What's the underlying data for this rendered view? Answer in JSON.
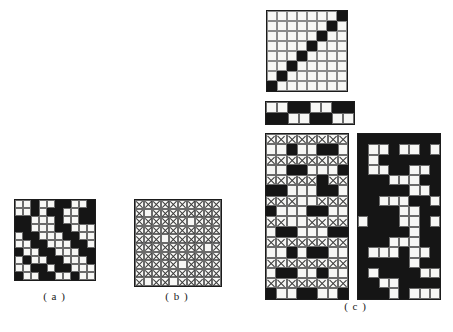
{
  "figure": {
    "kind": "binary-matrix-diagram",
    "background_color": "#ffffff",
    "ink_color": "#151515",
    "cell_fill_white": "#f7f7f5",
    "grid_line_color": "#6e6e6e",
    "cross_mark_color": "#3a3a3a"
  },
  "captions": {
    "a": "( a )",
    "b": "( b )",
    "c": "( c )"
  },
  "chart_data": {
    "type": "heatmap",
    "title": "",
    "xlabel": "",
    "ylabel": "",
    "legend": [
      {
        "name": "filled",
        "code": 1,
        "color": "#151515"
      },
      {
        "name": "empty",
        "code": 0,
        "color": "#f7f7f5"
      },
      {
        "name": "crossed",
        "code": 2,
        "color": "#f7f7f5"
      }
    ],
    "panels": [
      {
        "id": "a",
        "label": "( a )",
        "rows": 10,
        "cols": 10,
        "style": "binary",
        "matrix": [
          [
            0,
            0,
            1,
            0,
            0,
            1,
            1,
            0,
            0,
            1
          ],
          [
            0,
            0,
            1,
            0,
            1,
            1,
            0,
            0,
            1,
            1
          ],
          [
            1,
            1,
            0,
            0,
            0,
            1,
            0,
            0,
            1,
            1
          ],
          [
            1,
            1,
            0,
            0,
            0,
            1,
            1,
            0,
            0,
            0
          ],
          [
            0,
            1,
            1,
            0,
            0,
            0,
            1,
            1,
            0,
            0
          ],
          [
            0,
            0,
            1,
            1,
            0,
            0,
            0,
            1,
            1,
            0
          ],
          [
            1,
            0,
            0,
            1,
            1,
            0,
            0,
            0,
            1,
            1
          ],
          [
            0,
            1,
            0,
            0,
            1,
            1,
            0,
            0,
            0,
            1
          ],
          [
            0,
            0,
            1,
            1,
            0,
            1,
            1,
            0,
            0,
            0
          ],
          [
            1,
            0,
            0,
            1,
            1,
            0,
            0,
            1,
            0,
            0
          ]
        ]
      },
      {
        "id": "b",
        "label": "( b )",
        "rows": 10,
        "cols": 10,
        "style": "crossed",
        "matrix": [
          [
            2,
            2,
            2,
            2,
            2,
            2,
            2,
            2,
            2,
            2
          ],
          [
            2,
            0,
            2,
            2,
            2,
            2,
            2,
            2,
            2,
            2
          ],
          [
            2,
            2,
            2,
            2,
            2,
            2,
            0,
            2,
            2,
            2
          ],
          [
            2,
            2,
            2,
            2,
            2,
            2,
            2,
            2,
            2,
            2
          ],
          [
            2,
            2,
            2,
            0,
            2,
            2,
            2,
            2,
            2,
            2
          ],
          [
            2,
            2,
            2,
            2,
            2,
            2,
            2,
            2,
            0,
            2
          ],
          [
            2,
            2,
            2,
            2,
            2,
            2,
            2,
            2,
            2,
            2
          ],
          [
            2,
            2,
            2,
            2,
            2,
            0,
            2,
            2,
            2,
            2
          ],
          [
            2,
            2,
            2,
            2,
            2,
            2,
            2,
            2,
            2,
            2
          ],
          [
            2,
            0,
            2,
            2,
            0,
            2,
            2,
            2,
            2,
            2
          ]
        ]
      },
      {
        "id": "c-diagonal",
        "label": "",
        "parent": "c",
        "rows": 8,
        "cols": 8,
        "style": "binary-thin",
        "matrix": [
          [
            0,
            0,
            0,
            0,
            0,
            0,
            0,
            1
          ],
          [
            0,
            0,
            0,
            0,
            0,
            0,
            1,
            0
          ],
          [
            0,
            0,
            0,
            0,
            0,
            1,
            0,
            0
          ],
          [
            0,
            0,
            0,
            0,
            1,
            0,
            0,
            0
          ],
          [
            0,
            0,
            0,
            1,
            0,
            0,
            0,
            0
          ],
          [
            0,
            0,
            1,
            0,
            0,
            0,
            0,
            0
          ],
          [
            0,
            1,
            0,
            0,
            0,
            0,
            0,
            0
          ],
          [
            1,
            0,
            0,
            0,
            0,
            0,
            0,
            0
          ]
        ]
      },
      {
        "id": "c-strip",
        "label": "",
        "parent": "c",
        "rows": 2,
        "cols": 8,
        "style": "binary",
        "matrix": [
          [
            0,
            0,
            1,
            1,
            0,
            0,
            1,
            1
          ],
          [
            1,
            1,
            0,
            0,
            1,
            1,
            0,
            0
          ]
        ]
      },
      {
        "id": "c-left",
        "label": "",
        "parent": "c",
        "rows": 16,
        "cols": 8,
        "style": "mixed",
        "matrix": [
          [
            2,
            2,
            2,
            2,
            2,
            2,
            2,
            2
          ],
          [
            0,
            0,
            1,
            0,
            0,
            1,
            1,
            0
          ],
          [
            2,
            2,
            2,
            2,
            2,
            2,
            2,
            2
          ],
          [
            0,
            0,
            1,
            1,
            0,
            0,
            0,
            1
          ],
          [
            2,
            2,
            2,
            2,
            2,
            1,
            2,
            2
          ],
          [
            1,
            1,
            0,
            0,
            0,
            1,
            1,
            0
          ],
          [
            2,
            2,
            2,
            0,
            0,
            2,
            2,
            2
          ],
          [
            1,
            0,
            0,
            0,
            1,
            1,
            0,
            0
          ],
          [
            2,
            2,
            0,
            0,
            2,
            2,
            2,
            2
          ],
          [
            0,
            1,
            1,
            0,
            0,
            0,
            1,
            1
          ],
          [
            2,
            2,
            2,
            2,
            2,
            2,
            2,
            2
          ],
          [
            0,
            0,
            1,
            0,
            1,
            1,
            0,
            0
          ],
          [
            2,
            2,
            2,
            2,
            2,
            2,
            2,
            2
          ],
          [
            0,
            1,
            1,
            0,
            0,
            1,
            0,
            0
          ],
          [
            2,
            2,
            2,
            2,
            2,
            2,
            2,
            2
          ],
          [
            1,
            0,
            0,
            1,
            1,
            0,
            0,
            1
          ]
        ]
      },
      {
        "id": "c-right",
        "label": "",
        "parent": "c",
        "rows": 16,
        "cols": 8,
        "style": "binary",
        "matrix": [
          [
            1,
            1,
            1,
            1,
            1,
            1,
            1,
            1
          ],
          [
            1,
            0,
            0,
            1,
            0,
            0,
            1,
            0
          ],
          [
            1,
            0,
            1,
            1,
            1,
            1,
            1,
            1
          ],
          [
            1,
            0,
            0,
            1,
            1,
            0,
            0,
            1
          ],
          [
            1,
            1,
            1,
            0,
            0,
            0,
            1,
            1
          ],
          [
            1,
            1,
            1,
            1,
            1,
            0,
            0,
            1
          ],
          [
            1,
            1,
            0,
            0,
            0,
            1,
            1,
            0
          ],
          [
            1,
            1,
            1,
            1,
            0,
            0,
            1,
            1
          ],
          [
            0,
            1,
            1,
            1,
            0,
            0,
            1,
            0
          ],
          [
            1,
            1,
            1,
            1,
            1,
            0,
            1,
            1
          ],
          [
            1,
            1,
            1,
            0,
            0,
            0,
            1,
            1
          ],
          [
            1,
            0,
            0,
            0,
            1,
            0,
            0,
            1
          ],
          [
            1,
            1,
            1,
            1,
            1,
            0,
            1,
            1
          ],
          [
            1,
            0,
            1,
            1,
            1,
            1,
            0,
            0
          ],
          [
            1,
            1,
            0,
            0,
            1,
            1,
            1,
            1
          ],
          [
            1,
            1,
            1,
            0,
            1,
            0,
            0,
            0
          ]
        ]
      }
    ]
  }
}
